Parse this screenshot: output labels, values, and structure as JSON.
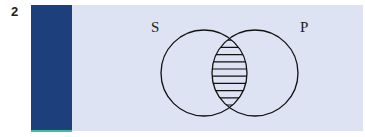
{
  "figure_number": "2",
  "diagram": {
    "type": "venn",
    "sets": [
      {
        "label": "S",
        "cx": 204,
        "cy": 73,
        "r": 43
      },
      {
        "label": "P",
        "cx": 255,
        "cy": 73,
        "r": 43
      }
    ],
    "shaded_region": "S∩P",
    "shading": "horizontal-lines",
    "colors": {
      "bar": "#1d3f7c",
      "bar_base": "#3fbf9a",
      "panel": "#dde3f2",
      "stroke": "#111111",
      "highlight_line": "#d070c0"
    }
  }
}
